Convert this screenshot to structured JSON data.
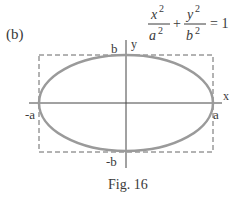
{
  "figure": {
    "panel_label": "(b)",
    "caption": "Fig. 16",
    "equation": {
      "term1_num": "x",
      "term1_den": "a",
      "term2_num": "y",
      "term2_den": "b",
      "exponent": "2",
      "plus": "+",
      "equals": "= 1"
    },
    "axes": {
      "x_label": "x",
      "y_label": "y"
    },
    "intercepts": {
      "pos_x": "a",
      "neg_x": "-a",
      "pos_y": "b",
      "neg_y": "-b"
    },
    "colors": {
      "ellipse": "#9a9a9a",
      "axes": "#444444",
      "box": "#666666",
      "text": "#3a3a3a"
    }
  }
}
